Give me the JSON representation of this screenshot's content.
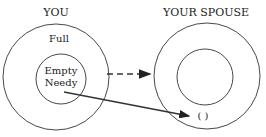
{
  "left": {
    "title": "YOU",
    "outer_label": "Full",
    "inner_label_1": "Empty",
    "inner_label_2": "Needy"
  },
  "right": {
    "title": "YOUR SPOUSE",
    "target_label": "(   )"
  },
  "colors": {
    "stroke": "#222222",
    "text": "#222222"
  }
}
